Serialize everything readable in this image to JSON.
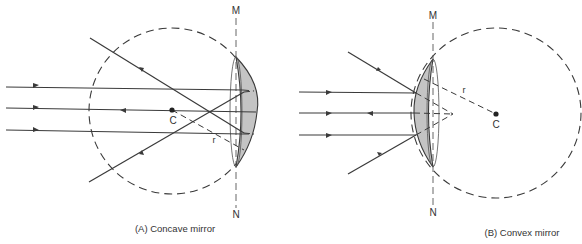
{
  "figure_a": {
    "caption": "(A)  Concave mirror",
    "label_m": "M",
    "label_n": "N",
    "label_center": "C",
    "label_radius": "r"
  },
  "figure_b": {
    "caption": "(B)  Convex mirror",
    "label_m": "M",
    "label_n": "N",
    "label_center": "C",
    "label_radius": "r"
  },
  "colors": {
    "line": "#3a3a3a",
    "mirror_fill": "#c4c4c4",
    "background": "#ffffff"
  }
}
